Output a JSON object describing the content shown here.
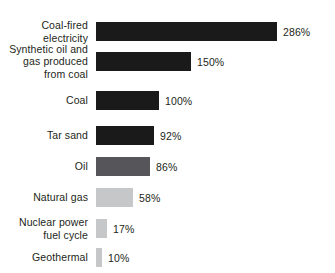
{
  "chart_data": {
    "type": "bar",
    "orientation": "horizontal",
    "title": "",
    "subtitle": "",
    "xlabel": "",
    "ylabel": "",
    "grid": false,
    "legend": "none",
    "axis_visible": false,
    "xlim": [
      0,
      286
    ],
    "value_suffix": "%",
    "categories": [
      "Coal-fired\nelectricity",
      "Synthetic oil and\ngas produced\nfrom coal",
      "Coal",
      "Tar sand",
      "Oil",
      "Natural gas",
      "Nuclear power\nfuel cycle",
      "Geothermal"
    ],
    "values": [
      286,
      150,
      100,
      92,
      86,
      58,
      17,
      10
    ],
    "value_labels": [
      "286%",
      "150%",
      "100%",
      "92%",
      "86%",
      "58%",
      "17%",
      "10%"
    ],
    "bar_colors": [
      "#1a1a1a",
      "#1a1a1a",
      "#1a1a1a",
      "#1a1a1a",
      "#56565a",
      "#c6c7c9",
      "#c6c7c9",
      "#c6c7c9"
    ],
    "row_tops": [
      22,
      52,
      91,
      126,
      157,
      188,
      219,
      248
    ],
    "bar_heights": [
      19,
      19,
      19,
      19,
      19,
      19,
      19,
      19
    ],
    "px_per_unit": 0.632,
    "bar_origin_x": 96
  }
}
